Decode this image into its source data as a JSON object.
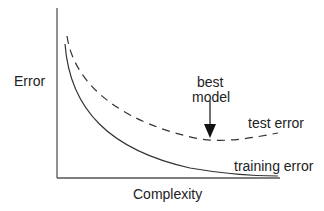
{
  "diagram": {
    "y_axis_label": "Error",
    "x_axis_label": "Complexity",
    "annotation": {
      "line1": "best",
      "line2": "model"
    },
    "curves": [
      {
        "name": "test error",
        "style": "dashed"
      },
      {
        "name": "training error",
        "style": "solid"
      }
    ],
    "colors": {
      "line": "#333333",
      "axis": "#555555"
    }
  }
}
